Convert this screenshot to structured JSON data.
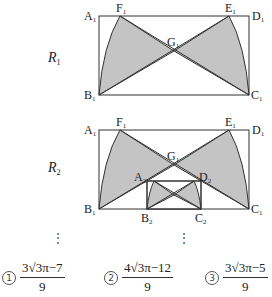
{
  "figure": {
    "fill_color": "#c4c4c4",
    "stroke_color": "#333333",
    "step1": {
      "label": "R",
      "label_sub": "1",
      "points": {
        "A": "A1",
        "B": "B1",
        "C": "C1",
        "D": "D1",
        "E": "E1",
        "F": "F1",
        "G": "G1"
      }
    },
    "step2": {
      "label": "R",
      "label_sub": "2",
      "points": {
        "A": "A1",
        "B": "B1",
        "C": "C1",
        "D": "D1",
        "E": "E1",
        "F": "F1",
        "G": "G1",
        "A2": "A2",
        "B2": "B2",
        "C2": "C2",
        "D2": "D2"
      }
    },
    "ellipsis": "⋮"
  },
  "choices": [
    {
      "marker": "1",
      "numerator": "3√3π−7",
      "denominator": "9"
    },
    {
      "marker": "2",
      "numerator": "4√3π−12",
      "denominator": "9"
    },
    {
      "marker": "3",
      "numerator": "3√3π−5",
      "denominator": "9"
    }
  ]
}
